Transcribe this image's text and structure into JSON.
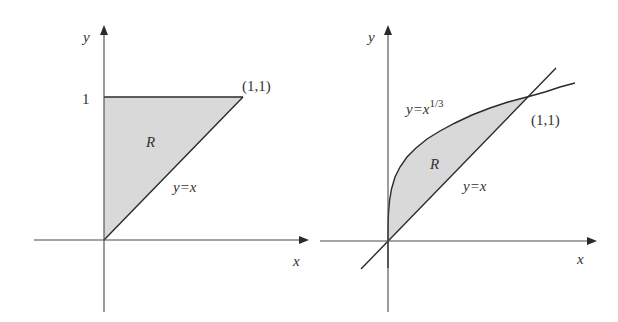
{
  "colors": {
    "region_fill": "#d9d9d9",
    "line": "#2a2a2a",
    "axis": "#4a4a4a",
    "text": "#333333"
  },
  "left_panel": {
    "axis_labels": {
      "x": "x",
      "y": "y"
    },
    "tick_label_y": "1",
    "point_label": "(1,1)",
    "region_label": "R",
    "line_label": "y=x",
    "region": "triangle bounded by x=0, y=1, y=x"
  },
  "right_panel": {
    "axis_labels": {
      "x": "x",
      "y": "y"
    },
    "point_label": "(1,1)",
    "region_label": "R",
    "line_label": "y=x",
    "curve_label_base": "y=x",
    "curve_label_exp": "1/3",
    "region": "area between y=x^(1/3) and y=x for 0≤x≤1"
  }
}
